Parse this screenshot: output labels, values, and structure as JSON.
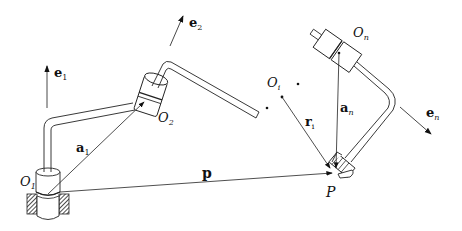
{
  "diagram": {
    "type": "robot-arm-kinematics",
    "labels": {
      "e1": {
        "base": "e",
        "sub": "1"
      },
      "e2": {
        "base": "e",
        "sub": "2"
      },
      "en": {
        "base": "e",
        "sub": "n"
      },
      "O1": {
        "base": "O",
        "sub": "1"
      },
      "O2": {
        "base": "O",
        "sub": "2"
      },
      "Oi": {
        "base": "O",
        "sub": "i"
      },
      "On": {
        "base": "O",
        "sub": "n"
      },
      "a1": {
        "base": "a",
        "sub": "1"
      },
      "an": {
        "base": "a",
        "sub": "n"
      },
      "ri": {
        "base": "r",
        "sub": "i"
      },
      "p": "p",
      "P": "P"
    },
    "colors": {
      "stroke": "#222222",
      "fill": "#ffffff",
      "hatch": "#333333"
    }
  }
}
